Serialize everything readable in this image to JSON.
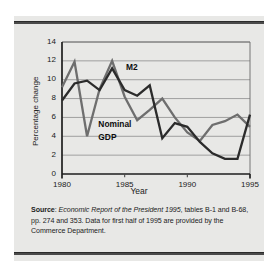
{
  "figure": {
    "background_color": "#e8e8e6",
    "rule_color": "#4a4a4a"
  },
  "source_note": {
    "label": "Source",
    "label_suffix": ": ",
    "italic_part": "Economic Report of the President 1995",
    "rest": ", tables B-1 and B-68, pp. 274 and 353. Data for first half of 1995 are provided by the Commerce Department."
  },
  "chart_data": {
    "type": "line",
    "title": "",
    "xlabel": "Year",
    "ylabel": "Percentage change",
    "xlim": [
      1980,
      1995
    ],
    "ylim": [
      0,
      14
    ],
    "ytick_step": 2,
    "yticks": [
      "14",
      "12",
      "10",
      "8",
      "6",
      "4",
      "2",
      "0"
    ],
    "ytick_values": [
      14,
      12,
      10,
      8,
      6,
      4,
      2,
      0
    ],
    "xticks": [
      "1980",
      "1985",
      "1990",
      "1995"
    ],
    "xtick_values": [
      1980,
      1985,
      1990,
      1995
    ],
    "minor_xtick_values": [
      1985,
      1990
    ],
    "grid": "horizontal",
    "legend_position": "inline-annotations",
    "x": [
      1980,
      1981,
      1982,
      1983,
      1984,
      1985,
      1986,
      1987,
      1988,
      1989,
      1990,
      1991,
      1992,
      1993,
      1994,
      1995
    ],
    "series": [
      {
        "name": "M2",
        "color": "#6e6e6e",
        "width": 2.3,
        "label_text": "M2",
        "values": [
          9.2,
          11.9,
          4.0,
          9.0,
          12.0,
          8.2,
          5.7,
          6.8,
          8.0,
          6.0,
          4.4,
          3.5,
          5.2,
          5.6,
          6.3,
          5.0
        ]
      },
      {
        "name": "Nominal GDP",
        "color": "#2b2b2b",
        "width": 2.3,
        "label_text": "Nominal\nGDP",
        "label_line_1": "Nominal",
        "label_line_2": "GDP",
        "values": [
          7.8,
          9.6,
          9.9,
          8.9,
          11.2,
          8.9,
          8.3,
          9.4,
          3.8,
          5.4,
          5.0,
          3.4,
          2.2,
          1.6,
          1.6,
          6.3
        ]
      }
    ],
    "annotations": [
      {
        "text": "M2",
        "x": 1985.1,
        "y": 11.3
      },
      {
        "text": "Nominal",
        "x": 1982.9,
        "y": 5.3
      },
      {
        "text": "GDP",
        "x": 1982.9,
        "y": 3.9
      }
    ]
  }
}
